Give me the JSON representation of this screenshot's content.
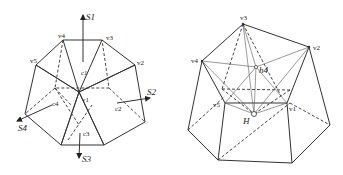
{
  "left_figure": {
    "vertex_labels": [
      "v1",
      "v2",
      "v3",
      "v4",
      "v5"
    ],
    "center_labels": [
      "c1",
      "c2",
      "c3",
      "c4"
    ],
    "axis_labels": [
      "S1",
      "S2",
      "S3",
      "S4"
    ],
    "colors": {
      "face_dark": "#b3b3b3",
      "face_mid": "#cfcfcf",
      "face_light": "#e2e2e2",
      "face_white": "#ffffff",
      "stroke": "#333333"
    }
  },
  "right_figure": {
    "vertex_labels": [
      "v1",
      "v2",
      "v3",
      "v4",
      "v5"
    ],
    "point_labels": [
      "h4",
      "H"
    ],
    "colors": {
      "top_face": "#a6a6a6",
      "stroke": "#333333"
    }
  }
}
